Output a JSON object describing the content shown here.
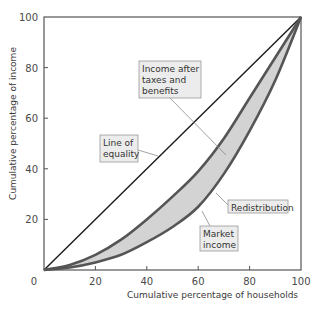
{
  "chart_data": {
    "type": "line",
    "title": "",
    "xlabel": "Cumulative percentage of households",
    "ylabel": "Cumulative percentage of income",
    "xlim": [
      0,
      100
    ],
    "ylim": [
      0,
      100
    ],
    "x_ticks": [
      "0",
      "20",
      "40",
      "60",
      "80",
      "100"
    ],
    "y_ticks": [
      "20",
      "40",
      "60",
      "80",
      "100"
    ],
    "origin_label": "0",
    "grid": false,
    "legend": "none (callout labels)",
    "x": [
      0,
      10,
      20,
      30,
      40,
      50,
      60,
      70,
      80,
      90,
      100
    ],
    "series": [
      {
        "name": "Line of equality",
        "values": [
          0,
          10,
          20,
          30,
          40,
          50,
          60,
          70,
          80,
          90,
          100
        ]
      },
      {
        "name": "Income after taxes and benefits",
        "values": [
          0,
          2,
          6,
          12,
          20,
          29,
          39,
          52,
          68,
          84,
          100
        ]
      },
      {
        "name": "Market income",
        "values": [
          0,
          1,
          3,
          6,
          11,
          17,
          25,
          38,
          55,
          75,
          100
        ]
      }
    ],
    "shaded_region": {
      "between": [
        "Income after taxes and benefits",
        "Market income"
      ],
      "label": "Redistribution"
    },
    "annotations": [
      {
        "text": "Income after taxes and benefits",
        "points_to": "Income after taxes and benefits"
      },
      {
        "text": "Line of equality",
        "points_to": "Line of equality"
      },
      {
        "text": "Redistribution",
        "points_to": "shaded region"
      },
      {
        "text": "Market income",
        "points_to": "Market income"
      }
    ],
    "colors": {
      "equality_line": "#1a1a1a",
      "curve_stroke": "#555555",
      "shade_fill": "#d3d3d3",
      "frame": "#555555",
      "callout_bg": "#ececec",
      "callout_border": "#9a9a9a",
      "leader": "#8a8a8a"
    }
  },
  "labels": {
    "callout_after_tax": [
      "Income after",
      "taxes and",
      "benefits"
    ],
    "callout_equality": [
      "Line of",
      "equality"
    ],
    "callout_redistribution": [
      "Redistribution"
    ],
    "callout_market": [
      "Market",
      "income"
    ]
  }
}
